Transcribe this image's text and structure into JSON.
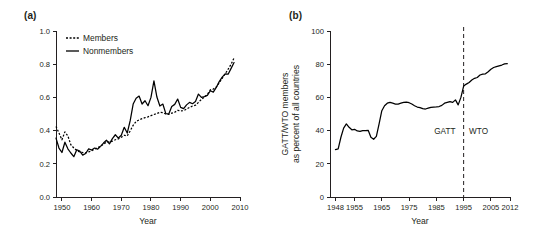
{
  "figure": {
    "panels": [
      {
        "label": "(a)"
      },
      {
        "label": "(b)"
      }
    ]
  },
  "panel_a": {
    "label": "(a)",
    "xlabel": "Year",
    "ylabel": "",
    "legend": {
      "members_label": "Members",
      "nonmembers_label": "Nonmembers"
    },
    "yticks": [
      "0.0",
      "0.2",
      "0.4",
      "0.6",
      "0.8",
      "1.0"
    ],
    "xticks": [
      "1950",
      "1960",
      "1970",
      "1980",
      "1990",
      "2000",
      "2010"
    ]
  },
  "panel_b": {
    "label": "(b)",
    "xlabel": "Year",
    "ylabel_line1": "GATT/WTO members",
    "ylabel_line2": "as percent of all countries",
    "annotation_left": "GATT",
    "annotation_right": "WTO",
    "yticks": [
      "0",
      "20",
      "40",
      "60",
      "80",
      "100"
    ],
    "xticks": [
      "1948",
      "1955",
      "1965",
      "1975",
      "1985",
      "1995",
      "2005",
      "2012"
    ]
  },
  "colors": {
    "ink": "#231f20",
    "line": "#000000",
    "background": "#ffffff"
  },
  "chart_data": [
    {
      "type": "line",
      "id": "panel-a",
      "title": "(a)",
      "xlabel": "Year",
      "ylabel": "",
      "xlim": [
        1948,
        2010
      ],
      "ylim": [
        0.0,
        1.0
      ],
      "grid": false,
      "legend_position": "top-left",
      "xticks": [
        1950,
        1960,
        1970,
        1980,
        1990,
        2000,
        2010
      ],
      "yticks": [
        0.0,
        0.2,
        0.4,
        0.6,
        0.8,
        1.0
      ],
      "x": [
        1948,
        1949,
        1950,
        1951,
        1952,
        1953,
        1954,
        1955,
        1956,
        1957,
        1958,
        1959,
        1960,
        1961,
        1962,
        1963,
        1964,
        1965,
        1966,
        1967,
        1968,
        1969,
        1970,
        1971,
        1972,
        1973,
        1974,
        1975,
        1976,
        1977,
        1978,
        1979,
        1980,
        1981,
        1982,
        1983,
        1984,
        1985,
        1986,
        1987,
        1988,
        1989,
        1990,
        1991,
        1992,
        1993,
        1994,
        1995,
        1996,
        1997,
        1998,
        1999,
        2000,
        2001,
        2002,
        2003,
        2004,
        2005,
        2006,
        2007,
        2008
      ],
      "series": [
        {
          "name": "Members",
          "style": "dotted",
          "values": [
            0.425,
            0.385,
            0.345,
            0.392,
            0.368,
            0.315,
            0.295,
            0.28,
            0.272,
            0.268,
            0.266,
            0.272,
            0.278,
            0.288,
            0.297,
            0.305,
            0.318,
            0.33,
            0.332,
            0.336,
            0.345,
            0.35,
            0.36,
            0.372,
            0.368,
            0.398,
            0.432,
            0.455,
            0.465,
            0.472,
            0.478,
            0.483,
            0.49,
            0.497,
            0.503,
            0.51,
            0.508,
            0.5,
            0.498,
            0.505,
            0.51,
            0.522,
            0.518,
            0.52,
            0.53,
            0.54,
            0.548,
            0.553,
            0.57,
            0.588,
            0.602,
            0.618,
            0.645,
            0.65,
            0.662,
            0.688,
            0.715,
            0.742,
            0.77,
            0.8,
            0.838
          ]
        },
        {
          "name": "Nonmembers",
          "style": "solid",
          "values": [
            0.355,
            0.295,
            0.268,
            0.33,
            0.29,
            0.265,
            0.243,
            0.285,
            0.276,
            0.252,
            0.262,
            0.29,
            0.283,
            0.295,
            0.288,
            0.305,
            0.325,
            0.342,
            0.32,
            0.352,
            0.375,
            0.355,
            0.372,
            0.42,
            0.385,
            0.46,
            0.56,
            0.595,
            0.608,
            0.56,
            0.58,
            0.55,
            0.6,
            0.7,
            0.602,
            0.548,
            0.56,
            0.502,
            0.5,
            0.545,
            0.558,
            0.59,
            0.54,
            0.532,
            0.555,
            0.57,
            0.562,
            0.575,
            0.62,
            0.6,
            0.605,
            0.612,
            0.64,
            0.632,
            0.66,
            0.695,
            0.722,
            0.742,
            0.74,
            0.775,
            0.81
          ]
        }
      ]
    },
    {
      "type": "line",
      "id": "panel-b",
      "title": "(b)",
      "xlabel": "Year",
      "ylabel": "GATT/WTO members as percent of all countries",
      "xlim": [
        1946,
        2012
      ],
      "ylim": [
        0,
        100
      ],
      "grid": false,
      "legend_position": "none",
      "xticks": [
        1948,
        1955,
        1965,
        1975,
        1985,
        1995,
        2005,
        2012
      ],
      "yticks": [
        0,
        20,
        40,
        60,
        80,
        100
      ],
      "annotations": [
        {
          "text": "GATT",
          "x": 1992,
          "y": 38,
          "align": "right"
        },
        {
          "text": "WTO",
          "x": 1997,
          "y": 38,
          "align": "left"
        },
        {
          "type": "vline",
          "x": 1995
        }
      ],
      "x": [
        1948,
        1949,
        1950,
        1951,
        1952,
        1953,
        1954,
        1955,
        1956,
        1957,
        1958,
        1959,
        1960,
        1961,
        1962,
        1963,
        1964,
        1965,
        1966,
        1967,
        1968,
        1969,
        1970,
        1971,
        1972,
        1973,
        1974,
        1975,
        1976,
        1977,
        1978,
        1979,
        1980,
        1981,
        1982,
        1983,
        1984,
        1985,
        1986,
        1987,
        1988,
        1989,
        1990,
        1991,
        1992,
        1993,
        1994,
        1995,
        1996,
        1997,
        1998,
        1999,
        2000,
        2001,
        2002,
        2003,
        2004,
        2005,
        2006,
        2007,
        2008,
        2009,
        2010,
        2011
      ],
      "series": [
        {
          "name": "GATT/WTO members as percent of all countries",
          "style": "solid",
          "values": [
            28.5,
            29.0,
            36.0,
            41.5,
            44.0,
            42.0,
            40.5,
            40.8,
            39.8,
            39.5,
            40.0,
            40.0,
            40.2,
            36.0,
            34.8,
            36.5,
            44.0,
            52.0,
            55.0,
            56.5,
            57.0,
            56.5,
            56.0,
            56.0,
            56.5,
            57.0,
            57.2,
            56.8,
            56.0,
            55.0,
            54.2,
            53.8,
            53.2,
            53.0,
            53.5,
            54.0,
            54.2,
            54.3,
            54.5,
            55.2,
            56.5,
            57.0,
            57.5,
            57.0,
            58.5,
            55.5,
            60.0,
            66.8,
            68.0,
            69.0,
            70.5,
            71.5,
            72.0,
            73.5,
            74.0,
            74.2,
            75.5,
            77.0,
            78.0,
            78.5,
            79.0,
            79.5,
            80.2,
            80.3
          ]
        }
      ]
    }
  ]
}
